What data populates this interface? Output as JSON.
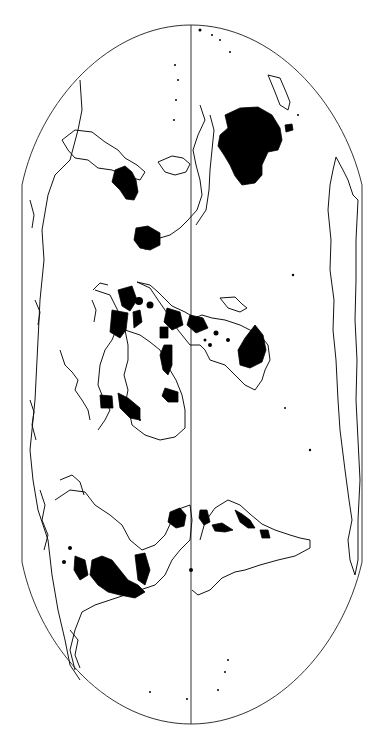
{
  "map": {
    "type": "world-map-rotated",
    "projection_frame": "flat-polar pseudocylindrical (rotated 90°)",
    "colors": {
      "background": "#ffffff",
      "outline": "#333333",
      "coastline": "#111111",
      "highlight_fill": "#000000"
    },
    "frame": {
      "top_y": 25,
      "bottom_y": 724,
      "left_x": 22,
      "right_x": 362,
      "straight_side_start_y": 185,
      "straight_side_end_y": 562,
      "central_meridian_x": 191
    },
    "layers": [
      {
        "name": "frame-outline"
      },
      {
        "name": "central-meridian"
      },
      {
        "name": "coastlines"
      },
      {
        "name": "highlighted-regions"
      }
    ],
    "labels": []
  }
}
